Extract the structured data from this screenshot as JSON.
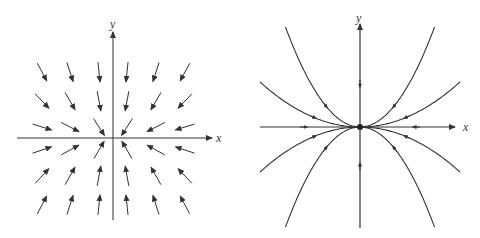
{
  "left_panel": {
    "title": "direction field",
    "x_label": "x",
    "y_label": "y",
    "origin": [
      113,
      138
    ],
    "grid_columns": [
      42,
      70,
      99,
      127,
      156,
      185
    ],
    "grid_rows": [
      72,
      101,
      127,
      150,
      176,
      205
    ]
  },
  "right_panel": {
    "title": "phase portrait",
    "x_label": "x",
    "y_label": "y",
    "origin": [
      360,
      127
    ]
  },
  "colors": {
    "ink": "#333333",
    "background": "#ffffff"
  }
}
